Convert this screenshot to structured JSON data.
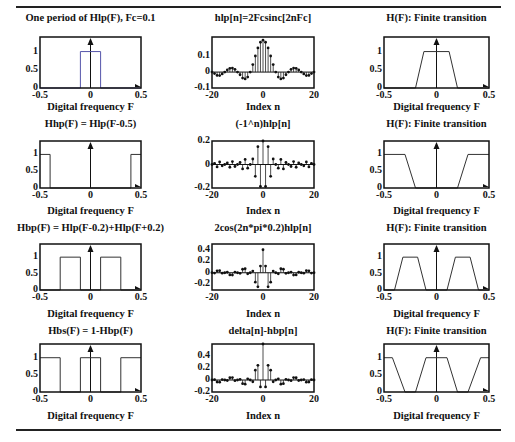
{
  "page": {
    "header_fragment": "g",
    "rules": [
      "top-rule",
      "bottom-rule"
    ]
  },
  "labels": {
    "freq_xlabel": "Digital frequency  F",
    "index_xlabel": "Index  n"
  },
  "chart_data": [
    {
      "id": "r1c1",
      "type": "line",
      "title": "One period of Hlp(F), Fc=0.1",
      "xlabel": "Digital frequency  F",
      "ylabel": "",
      "xlim": [
        -0.5,
        0.5
      ],
      "ylim": [
        0,
        1.4
      ],
      "xticks": [
        "-0.5",
        "0",
        "0.5"
      ],
      "yticks": [
        "0",
        "0.5",
        "1"
      ],
      "x": [
        -0.5,
        -0.1,
        -0.1,
        0.1,
        0.1,
        0.5
      ],
      "y": [
        0,
        0,
        1,
        1,
        0,
        0
      ],
      "line_color": "#5555aa"
    },
    {
      "id": "r1c2",
      "type": "stem",
      "title": "hlp[n]=2Fcsinc[2nFc]",
      "xlabel": "Index  n",
      "xlim": [
        -20,
        20
      ],
      "ylim": [
        -0.1,
        0.22
      ],
      "xticks": [
        "-20",
        "0",
        "20"
      ],
      "yticks": [
        "-0.1",
        "0",
        "0.1"
      ],
      "n": [
        -20,
        -19,
        -18,
        -17,
        -16,
        -15,
        -14,
        -13,
        -12,
        -11,
        -10,
        -9,
        -8,
        -7,
        -6,
        -5,
        -4,
        -3,
        -2,
        -1,
        0,
        1,
        2,
        3,
        4,
        5,
        6,
        7,
        8,
        9,
        10,
        11,
        12,
        13,
        14,
        15,
        16,
        17,
        18,
        19,
        20
      ],
      "values": [
        0,
        -0.0097,
        -0.0208,
        -0.0222,
        -0.0117,
        0,
        0.0134,
        0.0233,
        0.0252,
        0.0169,
        0,
        -0.0169,
        -0.0378,
        -0.0432,
        -0.0312,
        0,
        0.0468,
        0.1009,
        0.1514,
        0.1871,
        0.2,
        0.1871,
        0.1514,
        0.1009,
        0.0468,
        0,
        -0.0312,
        -0.0432,
        -0.0378,
        -0.0169,
        0,
        0.0169,
        0.0252,
        0.0233,
        0.0134,
        0,
        -0.0117,
        -0.0222,
        -0.0208,
        -0.0097,
        0
      ]
    },
    {
      "id": "r1c3",
      "type": "line",
      "title": "H(F): Finite transition",
      "xlabel": "Digital frequency  F",
      "xlim": [
        -0.5,
        0.5
      ],
      "ylim": [
        0,
        1.4
      ],
      "xticks": [
        "-0.5",
        "0",
        "0.5"
      ],
      "yticks": [
        "0",
        "0.5",
        "1"
      ],
      "x": [
        -0.5,
        -0.2,
        -0.12,
        0.12,
        0.2,
        0.5
      ],
      "y": [
        0,
        0,
        1,
        1,
        0,
        0
      ]
    },
    {
      "id": "r2c1",
      "type": "line",
      "title": "Hhp(F) = Hlp(F-0.5)",
      "xlabel": "Digital frequency  F",
      "xlim": [
        -0.5,
        0.5
      ],
      "ylim": [
        0,
        1.4
      ],
      "xticks": [
        "-0.5",
        "0",
        "0.5"
      ],
      "yticks": [
        "0",
        "0.5",
        "1"
      ],
      "x": [
        -0.5,
        -0.4,
        -0.4,
        0.4,
        0.4,
        0.5
      ],
      "y": [
        1,
        1,
        0,
        0,
        1,
        1
      ]
    },
    {
      "id": "r2c2",
      "type": "stem",
      "title": "(-1^n)hlp[n]",
      "xlabel": "Index  n",
      "xlim": [
        -20,
        20
      ],
      "ylim": [
        -0.2,
        0.2
      ],
      "xticks": [
        "-20",
        "0",
        "20"
      ],
      "yticks": [
        "-0.2",
        "0",
        "0.2"
      ],
      "note": "values = (-1)^n * hlp[n]"
    },
    {
      "id": "r2c3",
      "type": "line",
      "title": "H(F): Finite transition",
      "xlabel": "Digital frequency  F",
      "xlim": [
        -0.5,
        0.5
      ],
      "ylim": [
        0,
        1.4
      ],
      "xticks": [
        "-0.5",
        "0",
        "0.5"
      ],
      "yticks": [
        "0",
        "0.5",
        "1"
      ],
      "x": [
        -0.5,
        -0.3,
        -0.2,
        0.2,
        0.3,
        0.5
      ],
      "y": [
        1,
        1,
        0,
        0,
        1,
        1
      ]
    },
    {
      "id": "r3c1",
      "type": "line",
      "title": "Hbp(F) = Hlp(F-0.2)+Hlp(F+0.2)",
      "xlabel": "Digital frequency  F",
      "xlim": [
        -0.5,
        0.5
      ],
      "ylim": [
        0,
        1.4
      ],
      "xticks": [
        "-0.5",
        "0",
        "0.5"
      ],
      "yticks": [
        "0",
        "0.5",
        "1"
      ],
      "x": [
        -0.5,
        -0.3,
        -0.3,
        -0.1,
        -0.1,
        0.1,
        0.1,
        0.3,
        0.3,
        0.5
      ],
      "y": [
        0,
        0,
        1,
        1,
        0,
        0,
        1,
        1,
        0,
        0
      ]
    },
    {
      "id": "r3c2",
      "type": "stem",
      "title": "2cos(2n*pi*0.2)hlp[n]",
      "xlabel": "Index  n",
      "xlim": [
        -20,
        20
      ],
      "ylim": [
        -0.3,
        0.5
      ],
      "xticks": [
        "-20",
        "0",
        "20"
      ],
      "yticks": [
        "-0.2",
        "0",
        "0.2",
        "0.4"
      ],
      "note": "values = 2*cos(2*pi*0.2*n) * hlp[n]"
    },
    {
      "id": "r3c3",
      "type": "line",
      "title": "H(F): Finite transition",
      "xlabel": "Digital frequency  F",
      "xlim": [
        -0.5,
        0.5
      ],
      "ylim": [
        0,
        1.4
      ],
      "xticks": [
        "-0.5",
        "0",
        "0.5"
      ],
      "yticks": [
        "0",
        "0.5",
        "1"
      ],
      "x": [
        -0.5,
        -0.4,
        -0.32,
        -0.18,
        -0.1,
        0.1,
        0.18,
        0.32,
        0.4,
        0.5
      ],
      "y": [
        0,
        0,
        1,
        1,
        0,
        0,
        1,
        1,
        0,
        0
      ]
    },
    {
      "id": "r4c1",
      "type": "line",
      "title": "Hbs(F) = 1-Hbp(F)",
      "xlabel": "Digital frequency  F",
      "xlim": [
        -0.5,
        0.5
      ],
      "ylim": [
        0,
        1.4
      ],
      "xticks": [
        "-0.5",
        "0",
        "0.5"
      ],
      "yticks": [
        "0",
        "0.5",
        "1"
      ],
      "x": [
        -0.5,
        -0.3,
        -0.3,
        -0.1,
        -0.1,
        0.1,
        0.1,
        0.3,
        0.3,
        0.5
      ],
      "y": [
        1,
        1,
        0,
        0,
        1,
        1,
        0,
        0,
        1,
        1
      ]
    },
    {
      "id": "r4c2",
      "type": "stem",
      "title": "delta[n]-hbp[n]",
      "xlabel": "Index  n",
      "xlim": [
        -20,
        20
      ],
      "ylim": [
        -0.2,
        0.6
      ],
      "xticks": [
        "-20",
        "0",
        "20"
      ],
      "yticks": [
        "-0.2",
        "0",
        "0.2",
        "0.4"
      ],
      "note": "values = delta[n] - 2*cos(2*pi*0.2*n)*hlp[n]"
    },
    {
      "id": "r4c3",
      "type": "line",
      "title": "H(F): Finite transition",
      "xlabel": "Digital frequency  F",
      "xlim": [
        -0.5,
        0.5
      ],
      "ylim": [
        0,
        1.4
      ],
      "xticks": [
        "-0.5",
        "0",
        "0.5"
      ],
      "yticks": [
        "0",
        "0.5",
        "1"
      ],
      "x": [
        -0.5,
        -0.42,
        -0.3,
        -0.2,
        -0.1,
        0.1,
        0.2,
        0.3,
        0.42,
        0.5
      ],
      "y": [
        1,
        1,
        0,
        0,
        1,
        1,
        0,
        0,
        1,
        1
      ]
    }
  ]
}
